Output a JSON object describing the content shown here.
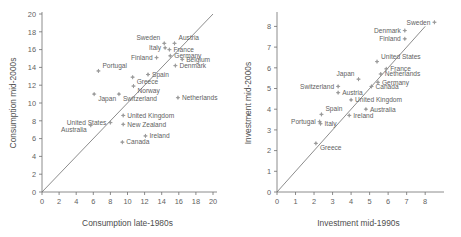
{
  "figure": {
    "background": "#ffffff",
    "marker_color": "#8d8d8d",
    "axis_color": "#6e6e6e",
    "text_color": "#5f5f5f"
  },
  "chart_data": [
    {
      "type": "scatter",
      "id": "consumption",
      "title": "",
      "xlabel": "Consumption late-1980s",
      "ylabel": "Consumption mid-2000s",
      "xlim": [
        0,
        20
      ],
      "ylim": [
        0,
        20
      ],
      "xticks": [
        0,
        2,
        4,
        6,
        8,
        10,
        12,
        14,
        16,
        18,
        20
      ],
      "yticks": [
        0,
        2,
        4,
        6,
        8,
        10,
        12,
        14,
        16,
        18,
        20
      ],
      "grid": false,
      "reference_line": {
        "type": "identity",
        "from": [
          0,
          0
        ],
        "to": [
          20,
          20
        ]
      },
      "points": [
        {
          "label": "Sweden",
          "x": 14.3,
          "y": 16.7,
          "label_pos": "left-above"
        },
        {
          "label": "Austria",
          "x": 15.5,
          "y": 16.7,
          "label_pos": "right-above"
        },
        {
          "label": "Italy",
          "x": 14.4,
          "y": 16.2,
          "label_pos": "left"
        },
        {
          "label": "France",
          "x": 14.9,
          "y": 16.0,
          "label_pos": "right"
        },
        {
          "label": "Germany",
          "x": 15.0,
          "y": 15.3,
          "label_pos": "right"
        },
        {
          "label": "Finland",
          "x": 13.4,
          "y": 15.1,
          "label_pos": "left"
        },
        {
          "label": "Belgium",
          "x": 16.4,
          "y": 14.9,
          "label_pos": "right"
        },
        {
          "label": "Denmark",
          "x": 15.6,
          "y": 14.2,
          "label_pos": "right"
        },
        {
          "label": "Portugal",
          "x": 6.6,
          "y": 13.6,
          "label_pos": "right-above"
        },
        {
          "label": "Spain",
          "x": 12.4,
          "y": 13.2,
          "label_pos": "right"
        },
        {
          "label": "Greece",
          "x": 10.6,
          "y": 12.9,
          "label_pos": "right-below"
        },
        {
          "label": "Norway",
          "x": 10.7,
          "y": 11.9,
          "label_pos": "right-below"
        },
        {
          "label": "Switzerland",
          "x": 9.0,
          "y": 11.0,
          "label_pos": "right-below"
        },
        {
          "label": "Japan",
          "x": 6.1,
          "y": 11.0,
          "label_pos": "right-below"
        },
        {
          "label": "Netherlands",
          "x": 15.9,
          "y": 10.6,
          "label_pos": "right"
        },
        {
          "label": "United Kingdom",
          "x": 9.5,
          "y": 8.6,
          "label_pos": "right"
        },
        {
          "label": "New Zealand",
          "x": 9.5,
          "y": 7.6,
          "label_pos": "right"
        },
        {
          "label": "United States",
          "x": 8.0,
          "y": 7.8,
          "label_pos": "left"
        },
        {
          "label": "Australia",
          "x": 5.7,
          "y": 7.5,
          "label_pos": "left-below"
        },
        {
          "label": "Ireland",
          "x": 12.1,
          "y": 6.3,
          "label_pos": "right"
        },
        {
          "label": "Canada",
          "x": 9.4,
          "y": 5.6,
          "label_pos": "right"
        }
      ]
    },
    {
      "type": "scatter",
      "id": "investment",
      "title": "",
      "xlabel": "Investment mid-1990s",
      "ylabel": "Investment mid-2000s",
      "xlim": [
        0,
        8.8
      ],
      "ylim": [
        0,
        8.6
      ],
      "xticks": [
        0,
        1,
        2,
        3,
        4,
        5,
        6,
        7,
        8
      ],
      "yticks": [
        0,
        1,
        2,
        3,
        4,
        5,
        6,
        7,
        8
      ],
      "grid": false,
      "reference_line": {
        "type": "identity",
        "from": [
          0,
          0
        ],
        "to": [
          8.0,
          8.0
        ]
      },
      "points": [
        {
          "label": "Sweden",
          "x": 8.5,
          "y": 8.2,
          "label_pos": "left"
        },
        {
          "label": "Denmark",
          "x": 6.9,
          "y": 7.8,
          "label_pos": "left"
        },
        {
          "label": "Finland",
          "x": 6.9,
          "y": 7.4,
          "label_pos": "left"
        },
        {
          "label": "United States",
          "x": 5.4,
          "y": 6.3,
          "label_pos": "right-above"
        },
        {
          "label": "France",
          "x": 5.9,
          "y": 5.95,
          "label_pos": "right"
        },
        {
          "label": "Netherlands",
          "x": 5.6,
          "y": 5.7,
          "label_pos": "right"
        },
        {
          "label": "Japan",
          "x": 4.4,
          "y": 5.45,
          "label_pos": "left-above"
        },
        {
          "label": "Germany",
          "x": 5.45,
          "y": 5.3,
          "label_pos": "right"
        },
        {
          "label": "Canada",
          "x": 5.1,
          "y": 5.1,
          "label_pos": "right"
        },
        {
          "label": "Switzerland",
          "x": 3.3,
          "y": 5.1,
          "label_pos": "left"
        },
        {
          "label": "Austria",
          "x": 3.3,
          "y": 4.8,
          "label_pos": "right"
        },
        {
          "label": "United Kingdom",
          "x": 4.0,
          "y": 4.45,
          "label_pos": "right"
        },
        {
          "label": "Australia",
          "x": 4.8,
          "y": 4.0,
          "label_pos": "right"
        },
        {
          "label": "Spain",
          "x": 2.4,
          "y": 3.75,
          "label_pos": "right-above"
        },
        {
          "label": "Ireland",
          "x": 3.9,
          "y": 3.7,
          "label_pos": "right"
        },
        {
          "label": "Portugal",
          "x": 2.3,
          "y": 3.4,
          "label_pos": "left"
        },
        {
          "label": "Italy",
          "x": 2.35,
          "y": 3.3,
          "label_pos": "right"
        },
        {
          "label": "Greece",
          "x": 2.1,
          "y": 2.35,
          "label_pos": "right-below"
        }
      ]
    }
  ]
}
